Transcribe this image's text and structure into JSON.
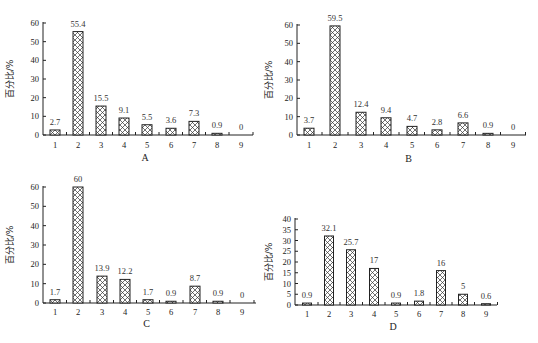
{
  "chart_data": [
    {
      "panel": "A",
      "type": "bar",
      "title": "",
      "xlabel": "A",
      "ylabel": "百分比/%",
      "categories": [
        "1",
        "2",
        "3",
        "4",
        "5",
        "6",
        "7",
        "8",
        "9"
      ],
      "values": [
        2.7,
        55.4,
        15.5,
        9.1,
        5.5,
        3.6,
        7.3,
        0.9,
        0
      ],
      "value_labels": [
        "2.7",
        "55.4",
        "15.5",
        "9.1",
        "5.5",
        "3.6",
        "7.3",
        "0.9",
        "0"
      ],
      "ylim": [
        0,
        60
      ],
      "yticks": [
        0,
        10,
        20,
        30,
        40,
        50,
        60
      ],
      "grid": false,
      "legend": null
    },
    {
      "panel": "B",
      "type": "bar",
      "title": "",
      "xlabel": "B",
      "ylabel": "百分比/%",
      "categories": [
        "1",
        "2",
        "3",
        "4",
        "5",
        "6",
        "7",
        "8",
        "9"
      ],
      "values": [
        3.7,
        59.5,
        12.4,
        9.4,
        4.7,
        2.8,
        6.6,
        0.9,
        0
      ],
      "value_labels": [
        "3.7",
        "59.5",
        "12.4",
        "9.4",
        "4.7",
        "2.8",
        "6.6",
        "0.9",
        "0"
      ],
      "ylim": [
        0,
        60
      ],
      "yticks": [
        0,
        10,
        20,
        30,
        40,
        50,
        60
      ],
      "grid": false,
      "legend": null
    },
    {
      "panel": "C",
      "type": "bar",
      "title": "",
      "xlabel": "C",
      "ylabel": "百分比/%",
      "categories": [
        "1",
        "2",
        "3",
        "4",
        "5",
        "6",
        "7",
        "8",
        "9"
      ],
      "values": [
        1.7,
        60,
        13.9,
        12.2,
        1.7,
        0.9,
        8.7,
        0.9,
        0
      ],
      "value_labels": [
        "1.7",
        "60",
        "13.9",
        "12.2",
        "1.7",
        "0.9",
        "8.7",
        "0.9",
        "0"
      ],
      "ylim": [
        0,
        60
      ],
      "yticks": [
        0,
        10,
        20,
        30,
        40,
        50,
        60
      ],
      "grid": false,
      "legend": null
    },
    {
      "panel": "D",
      "type": "bar",
      "title": "",
      "xlabel": "D",
      "ylabel": "百分比/%",
      "categories": [
        "1",
        "2",
        "3",
        "4",
        "5",
        "6",
        "7",
        "8",
        "9"
      ],
      "values": [
        0.9,
        32.1,
        25.7,
        17,
        0.9,
        1.8,
        16,
        5,
        0.6
      ],
      "value_labels": [
        "0.9",
        "32.1",
        "25.7",
        "17",
        "0.9",
        "1.8",
        "16",
        "5",
        "0.6"
      ],
      "ylim": [
        0,
        40
      ],
      "yticks": [
        0,
        5,
        10,
        15,
        20,
        25,
        30,
        35,
        40
      ],
      "grid": false,
      "legend": null
    }
  ],
  "layout": [
    {
      "axis_x": 43,
      "y_top": 23,
      "y_zero": 135,
      "x_end": 253,
      "centers": [
        55,
        78,
        101,
        124,
        147,
        171,
        194,
        217,
        241
      ],
      "cat_label_y": 148,
      "panel_label_y": 161,
      "ylabel_x": 13,
      "ylabel_y": 79,
      "bar_w": 10
    },
    {
      "axis_x": 297,
      "y_top": 25,
      "y_zero": 135,
      "x_end": 526,
      "centers": [
        309,
        335,
        361,
        386,
        412,
        437,
        463,
        488,
        513
      ],
      "cat_label_y": 148,
      "panel_label_y": 162,
      "ylabel_x": 272,
      "ylabel_y": 80,
      "bar_w": 10
    },
    {
      "axis_x": 43,
      "y_top": 187,
      "y_zero": 303,
      "x_end": 256,
      "centers": [
        55,
        78,
        102,
        125,
        148,
        171,
        195,
        218,
        242
      ],
      "cat_label_y": 315,
      "panel_label_y": 327,
      "ylabel_x": 13,
      "ylabel_y": 245,
      "bar_w": 10
    },
    {
      "axis_x": 295,
      "y_top": 219,
      "y_zero": 305,
      "x_end": 497,
      "centers": [
        307,
        329,
        351,
        374,
        396,
        419,
        441,
        463,
        486
      ],
      "cat_label_y": 317,
      "panel_label_y": 330,
      "ylabel_x": 272,
      "ylabel_y": 262,
      "bar_w": 9
    }
  ]
}
